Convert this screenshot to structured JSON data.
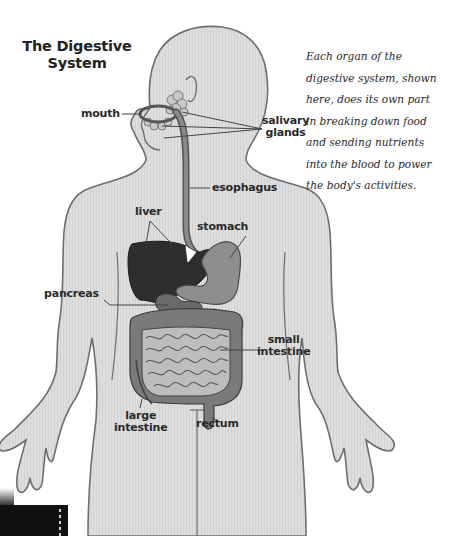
{
  "title": {
    "line1": "The Digestive",
    "line2": "System"
  },
  "caption": {
    "lines": [
      "Each organ of the",
      "digestive system, shown",
      "here, does its own part",
      "in breaking down food",
      "and sending nutrients",
      "into the blood to power",
      "the body's activities."
    ]
  },
  "labels": {
    "mouth": "mouth",
    "salivary_glands": [
      "salivary",
      "glands"
    ],
    "esophagus": "esophagus",
    "liver": "liver",
    "stomach": "stomach",
    "pancreas": "pancreas",
    "small_intestine": [
      "small",
      "intestine"
    ],
    "large_intestine": [
      "large",
      "intestine"
    ],
    "rectum": "rectum"
  },
  "colors": {
    "body_fill": "#dcdcdc",
    "body_outline": "#6e6e6e",
    "liver": "#2e2e2e",
    "stomach": "#8e8e8e",
    "large_intestine": "#7a7a7a",
    "small_intestine": "#bdbdbd",
    "esophagus": "#858585",
    "text": "#2a2a2a"
  }
}
